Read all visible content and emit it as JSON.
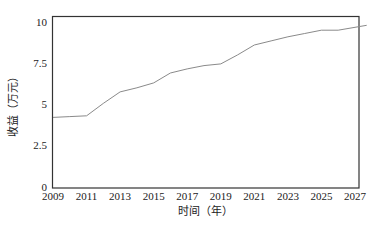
{
  "chart_data": {
    "type": "line",
    "title": "",
    "xlabel": "时间（年）",
    "ylabel": "收益（万元）",
    "xlim": [
      2009,
      2027.7
    ],
    "ylim": [
      0,
      10
    ],
    "grid": false,
    "legend": null,
    "x_ticks": [
      2009,
      2011,
      2013,
      2015,
      2017,
      2019,
      2021,
      2023,
      2025,
      2027
    ],
    "y_ticks": [
      0,
      2.5,
      5,
      7.5,
      10
    ],
    "y_tick_labels": [
      "0",
      "2.5",
      "5",
      "7.5",
      "10"
    ],
    "series": [
      {
        "name": "收益",
        "color": "#8a8a8a",
        "x": [
          2009,
          2010,
          2011,
          2012,
          2013,
          2014,
          2015,
          2016,
          2017,
          2018,
          2019,
          2020,
          2021,
          2022,
          2023,
          2024,
          2025,
          2026,
          2027.7
        ],
        "values": [
          4.2,
          4.25,
          4.3,
          5.05,
          5.75,
          6.0,
          6.3,
          6.9,
          7.15,
          7.35,
          7.45,
          8.0,
          8.6,
          8.85,
          9.1,
          9.3,
          9.5,
          9.5,
          9.8
        ]
      }
    ]
  }
}
